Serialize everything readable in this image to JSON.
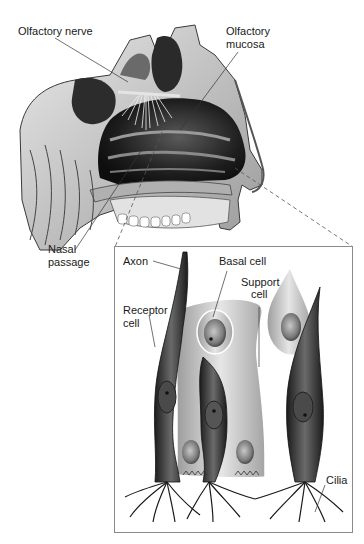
{
  "diagram": {
    "type": "anatomical-illustration",
    "main_view": {
      "name": "Sagittal section of nasal cavity",
      "labels": {
        "olfactory_nerve": "Olfactory nerve",
        "olfactory_mucosa_line1": "Olfactory",
        "olfactory_mucosa_line2": "mucosa",
        "nasal_passage_line1": "Nasal",
        "nasal_passage_line2": "passage"
      }
    },
    "inset_view": {
      "name": "Magnified olfactory epithelium",
      "labels": {
        "axon": "Axon",
        "basal_cell": "Basal cell",
        "support_cell_line1": "Support",
        "support_cell_line2": "cell",
        "receptor_cell_line1": "Receptor",
        "receptor_cell_line2": "cell",
        "cilia": "Cilia"
      }
    },
    "colors": {
      "background": "#ffffff",
      "ink": "#1a1a1a",
      "dark_tissue": "#2e2e2e",
      "mid_tissue": "#8c8c8c",
      "light_tissue": "#d6d6d6",
      "inset_border": "#8a8a8a"
    }
  }
}
